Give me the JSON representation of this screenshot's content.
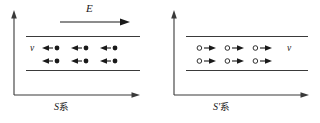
{
  "figure": {
    "type": "physics-diagram",
    "stroke_color": "#3a3a3a",
    "text_color": "#1a1a1a",
    "background": "#ffffff"
  },
  "efield": {
    "label": "E",
    "icon": "right-arrow-icon",
    "direction": "right"
  },
  "panels": [
    {
      "id": "S",
      "caption_symbol": "S",
      "caption_cjk": "系",
      "velocity_label": "v",
      "velocity_label_side": "left",
      "carrier_glyph": "filled-dot",
      "carrier_arrow_direction": "left",
      "rows": [
        {
          "count": 3
        },
        {
          "count": 3
        }
      ],
      "axis": {
        "vertical_arrow": "up",
        "horizontal_arrow": "right"
      }
    },
    {
      "id": "S'",
      "caption_symbol": "S'",
      "caption_cjk": "系",
      "velocity_label": "v",
      "velocity_label_side": "right",
      "carrier_glyph": "open-circle",
      "carrier_arrow_direction": "right",
      "rows": [
        {
          "count": 3
        },
        {
          "count": 3
        }
      ],
      "axis": {
        "vertical_arrow": "up",
        "horizontal_arrow": "right"
      }
    }
  ]
}
